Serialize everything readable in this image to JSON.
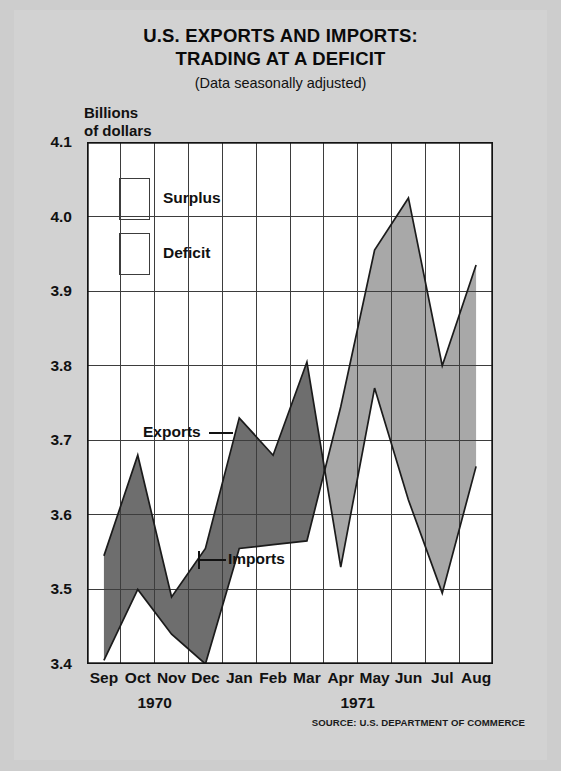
{
  "title": {
    "line1": "U.S. EXPORTS AND IMPORTS:",
    "line2": "TRADING AT A DEFICIT",
    "subtitle": "(Data seasonally adjusted)"
  },
  "axis_title": "Billions\nof dollars",
  "legend": {
    "surplus_label": "Surplus",
    "deficit_label": "Deficit",
    "surplus_color": "#6e6e6e",
    "deficit_color": "#a8a8a8"
  },
  "series_labels": {
    "exports": "Exports",
    "imports": "Imports"
  },
  "years": [
    {
      "label": "1970",
      "center_index": 1.5
    },
    {
      "label": "1971",
      "center_index": 7.5
    }
  ],
  "source": "SOURCE: U.S. DEPARTMENT OF COMMERCE",
  "chart_data": {
    "type": "area",
    "title": "U.S. EXPORTS AND IMPORTS: TRADING AT A DEFICIT",
    "subtitle": "(Data seasonally adjusted)",
    "xlabel": "",
    "ylabel": "Billions of dollars",
    "ylim": [
      3.4,
      4.1
    ],
    "yticks": [
      "3.4",
      "3.5",
      "3.6",
      "3.7",
      "3.8",
      "3.9",
      "4.0",
      "4.1"
    ],
    "ytick_values": [
      3.4,
      3.5,
      3.6,
      3.7,
      3.8,
      3.9,
      4.0,
      4.1
    ],
    "categories": [
      "Sep",
      "Oct",
      "Nov",
      "Dec",
      "Jan",
      "Feb",
      "Mar",
      "Apr",
      "May",
      "Jun",
      "Jul",
      "Aug"
    ],
    "grid": true,
    "legend_position": "upper-left-inside",
    "series": [
      {
        "name": "Exports",
        "values": [
          3.545,
          3.68,
          3.49,
          3.555,
          3.73,
          3.68,
          3.805,
          3.53,
          3.77,
          3.62,
          3.495,
          3.665
        ]
      },
      {
        "name": "Imports",
        "values": [
          3.405,
          3.5,
          3.44,
          3.4,
          3.555,
          3.56,
          3.565,
          3.745,
          3.955,
          4.025,
          3.8,
          3.935
        ]
      }
    ],
    "fill_rules": [
      {
        "name": "Surplus",
        "when": "exports > imports",
        "color": "#6e6e6e"
      },
      {
        "name": "Deficit",
        "when": "imports > exports",
        "color": "#a8a8a8"
      }
    ],
    "annotations": [
      {
        "text": "Exports",
        "anchor_category": "Jan",
        "anchor_value": 3.73
      },
      {
        "text": "Imports",
        "anchor_category": "Dec",
        "anchor_value": 3.5
      }
    ]
  }
}
